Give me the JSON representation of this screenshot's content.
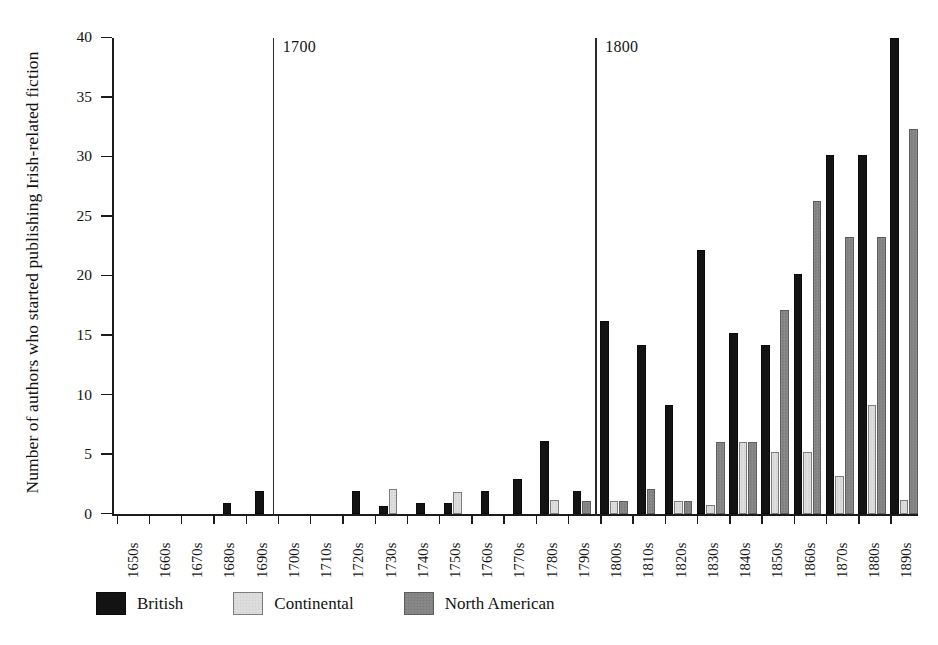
{
  "chart_data": {
    "type": "bar",
    "title": "",
    "xlabel": "",
    "ylabel": "Number of authors who started publishing Irish-related fiction",
    "ylim": [
      0,
      40
    ],
    "yticks": [
      0,
      5,
      10,
      15,
      20,
      25,
      30,
      35,
      40
    ],
    "ytick_labels": [
      "0",
      "5",
      "10",
      "15",
      "20",
      "25",
      "30",
      "35",
      "40"
    ],
    "grid": false,
    "legend_position": "bottom",
    "categories": [
      "1650s",
      "1660s",
      "1670s",
      "1680s",
      "1690s",
      "1700s",
      "1710s",
      "1720s",
      "1730s",
      "1740s",
      "1750s",
      "1760s",
      "1770s",
      "1780s",
      "1790s",
      "1800s",
      "1810s",
      "1820s",
      "1830s",
      "1840s",
      "1850s",
      "1860s",
      "1870s",
      "1880s",
      "1890s"
    ],
    "series": [
      {
        "name": "British",
        "color": "#131313",
        "values": [
          0,
          0,
          0,
          1,
          2,
          0,
          0,
          2,
          0.7,
          1,
          1,
          2,
          3,
          6.2,
          2,
          16.2,
          14.2,
          9.2,
          22.2,
          15.2,
          14.2,
          20.2,
          30.2,
          30.2,
          40
        ]
      },
      {
        "name": "Continental",
        "color": "#dcdcdc",
        "values": [
          0,
          0,
          0,
          0,
          0,
          0,
          0,
          0,
          2.1,
          0,
          1.9,
          0,
          0,
          1.2,
          0,
          1.1,
          0,
          1.1,
          0.8,
          6.1,
          5.2,
          5.2,
          3.2,
          9.2,
          1.2
        ]
      },
      {
        "name": "North American",
        "color": "#868686",
        "values": [
          0,
          0,
          0,
          0,
          0,
          0,
          0,
          0,
          0,
          0,
          0,
          0,
          0,
          0,
          1.1,
          1.1,
          2.1,
          1.1,
          6.1,
          6.1,
          17.2,
          26.3,
          23.3,
          23.3,
          32.4
        ]
      }
    ],
    "annotations": [
      {
        "text": "1700",
        "at_category": "1700s",
        "type": "vertical-rule"
      },
      {
        "text": "1800",
        "at_category": "1800s",
        "type": "vertical-rule"
      }
    ]
  },
  "legend": {
    "items": [
      {
        "label": "British",
        "key": "british"
      },
      {
        "label": "Continental",
        "key": "continental"
      },
      {
        "label": "North American",
        "key": "northamerican"
      }
    ]
  }
}
